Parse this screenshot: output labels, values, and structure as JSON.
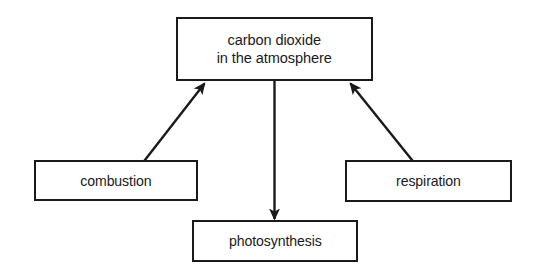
{
  "diagram": {
    "background_color": "#ffffff",
    "stroke_color": "#1a1a1a",
    "nodes": [
      {
        "id": "co2",
        "label": "carbon dioxide\nin the atmosphere",
        "shape": "rectangle"
      },
      {
        "id": "combustion",
        "label": "combustion",
        "shape": "rectangle"
      },
      {
        "id": "respiration",
        "label": "respiration",
        "shape": "rectangle"
      },
      {
        "id": "photosynthesis",
        "label": "photosynthesis",
        "shape": "rectangle"
      }
    ],
    "edges": [
      {
        "id": "combustion-to-co2",
        "from": "combustion",
        "to": "co2",
        "label": "",
        "arrowhead": "filled-triangle",
        "direction": "up-right"
      },
      {
        "id": "respiration-to-co2",
        "from": "respiration",
        "to": "co2",
        "label": "",
        "arrowhead": "filled-triangle",
        "direction": "up-left"
      },
      {
        "id": "co2-to-photosynthesis",
        "from": "co2",
        "to": "photosynthesis",
        "label": "",
        "arrowhead": "filled-triangle",
        "direction": "down"
      }
    ]
  }
}
